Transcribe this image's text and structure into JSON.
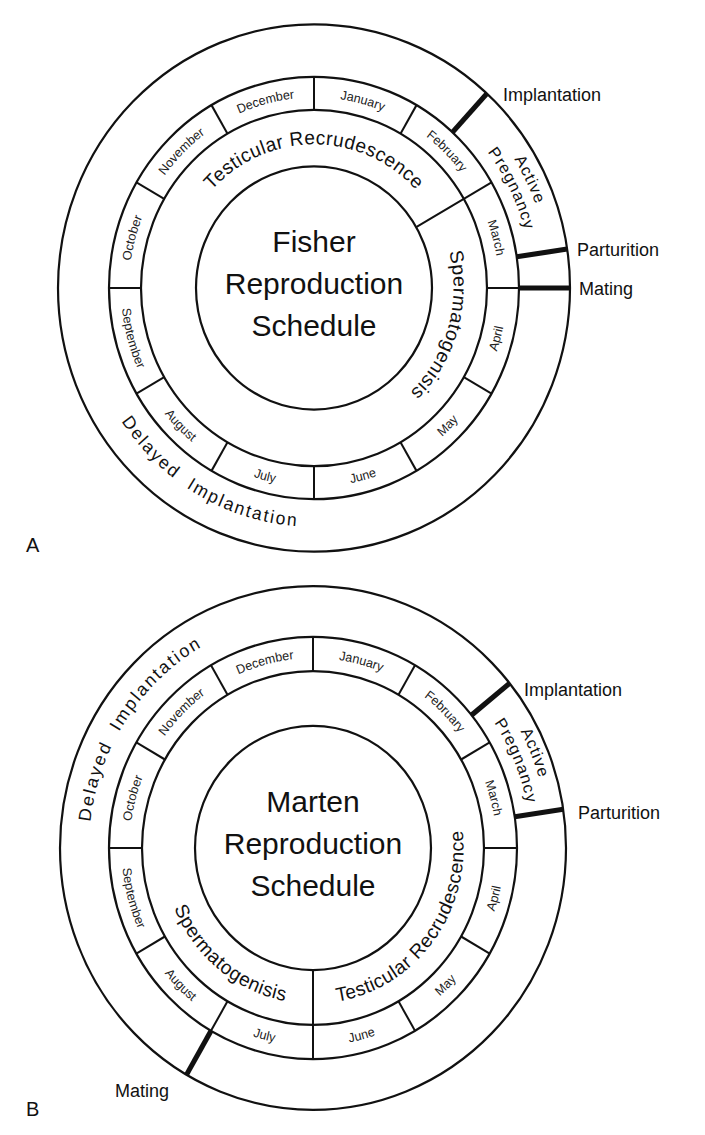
{
  "figure": {
    "months": [
      "January",
      "February",
      "March",
      "April",
      "May",
      "June",
      "July",
      "August",
      "September",
      "October",
      "November",
      "December"
    ],
    "panels": [
      {
        "id": "A",
        "panel_letter": "A",
        "letter_pos": [
          26,
          552
        ],
        "title_lines": [
          "Fisher",
          "Reproduction",
          "Schedule"
        ],
        "center": [
          314,
          288
        ],
        "y_scale": 1.03,
        "radii": {
          "outer": 256,
          "month_outer": 205,
          "month_inner": 173,
          "core": 118
        },
        "inner_dividers_deg": [
          60
        ],
        "inner_labels": [
          {
            "text": "Testicular Recrudescence",
            "start": -55,
            "end": 55,
            "dir": "cw"
          },
          {
            "text": "Spermatogenisis",
            "start": 62,
            "end": 150,
            "dir": "cw"
          }
        ],
        "outer_labels": [
          {
            "text": "Delayed  Implantation",
            "start": 268,
            "end": 152,
            "dir": "ccw",
            "radius": 232,
            "cls": "outer-text"
          },
          {
            "text": "Active",
            "start": 48,
            "end": 80,
            "dir": "cw",
            "radius": 236,
            "cls": "phase-small"
          },
          {
            "text": "Pregnancy",
            "start": 47,
            "end": 81,
            "dir": "cw",
            "radius": 218,
            "cls": "phase-small"
          }
        ],
        "events": [
          {
            "label": "Implantation",
            "angle": 42.5,
            "label_pos": [
              503,
              101
            ]
          },
          {
            "label": "Parturition",
            "angle": 81.5,
            "label_pos": [
              577,
              256
            ]
          },
          {
            "label": "Mating",
            "angle": 90,
            "label_pos": [
              579,
              295
            ]
          }
        ]
      },
      {
        "id": "B",
        "panel_letter": "B",
        "letter_pos": [
          26,
          1116
        ],
        "title_lines": [
          "Marten",
          "Reproduction",
          "Schedule"
        ],
        "center": [
          313,
          848
        ],
        "y_scale": 1.035,
        "radii": {
          "outer": 253,
          "month_outer": 204,
          "month_inner": 171,
          "core": 118
        },
        "inner_dividers_deg": [
          180
        ],
        "inner_labels": [
          {
            "text": "Testicular Recrudescence",
            "start": 174,
            "end": 80,
            "dir": "ccw"
          },
          {
            "text": "Spermatogenisis",
            "start": 252,
            "end": 186,
            "dir": "ccw"
          }
        ],
        "outer_labels": [
          {
            "text": "Delayed  Implantation",
            "start": 262,
            "end": 345,
            "dir": "cw",
            "radius": 224,
            "cls": "outer-text"
          },
          {
            "text": "Active",
            "start": 55,
            "end": 80,
            "dir": "cw",
            "radius": 236,
            "cls": "phase-small"
          },
          {
            "text": "Pregnancy",
            "start": 54,
            "end": 81,
            "dir": "cw",
            "radius": 218,
            "cls": "phase-small"
          }
        ],
        "events": [
          {
            "label": "Implantation",
            "angle": 51,
            "label_pos": [
              524,
              696
            ]
          },
          {
            "label": "Parturition",
            "angle": 81.5,
            "label_pos": [
              578,
              819
            ]
          },
          {
            "label": "Mating",
            "angle": 210,
            "label_pos": [
              115,
              1097
            ]
          }
        ]
      }
    ]
  }
}
